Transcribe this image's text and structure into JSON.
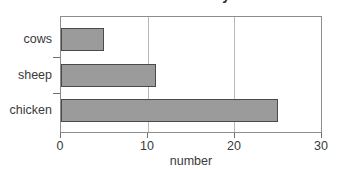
{
  "chart_data": {
    "type": "bar",
    "orientation": "horizontal",
    "title": "Animals in the barnyard",
    "xlabel": "number",
    "ylabel": "",
    "categories": [
      "cows",
      "sheep",
      "chicken"
    ],
    "values": [
      5,
      11,
      25
    ],
    "xlim": [
      0,
      30
    ],
    "xticks": [
      0,
      10,
      20,
      30
    ],
    "xticklabels": [
      "0",
      "10",
      "20",
      "30"
    ],
    "gridlines": [
      10,
      20
    ],
    "grid": true,
    "legend": null,
    "colors": {
      "bar_fill": "#9b9b9b",
      "bar_edge": "#4a4a4a",
      "frame": "#8c8c8c",
      "gridline": "#b9b9b9",
      "text": "#3a3a3a",
      "background": "#ffffff"
    }
  }
}
